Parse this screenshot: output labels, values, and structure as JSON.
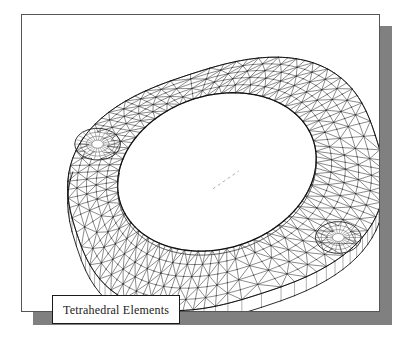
{
  "figure": {
    "caption": "Tetrahedral Elements",
    "background_color": "#ffffff",
    "frame_border_color": "#555555",
    "shadow_color": "#808080",
    "mesh_line_color": "#2b2b2b",
    "outline_color": "#111111"
  },
  "chart_data": {
    "type": "diagram",
    "title": "Tetrahedral Elements",
    "subtitle": "",
    "view": "isometric",
    "element_type": "tetrahedral",
    "legend": [
      {
        "label": "Tetrahedral Elements",
        "position": "bottom-left"
      }
    ],
    "annotations": [
      {
        "label": "Tetrahedral Elements",
        "x": 92,
        "y": 292
      }
    ],
    "geometry": {
      "outer_boundary": {
        "shape": "rounded-oval",
        "center_x": 205,
        "center_y": 170,
        "radius_x": 158,
        "radius_y": 116,
        "rotation_deg": -18
      },
      "inner_opening": {
        "shape": "ellipse",
        "center_x": 196,
        "center_y": 158,
        "radius_x": 102,
        "radius_y": 77,
        "rotation_deg": -18
      },
      "bolt_holes": [
        {
          "name": "upper-left-hole",
          "center_x": 76,
          "center_y": 130,
          "radius": 20
        },
        {
          "name": "lower-right-hole",
          "center_x": 318,
          "center_y": 224,
          "radius": 20
        }
      ],
      "extrusion_depth": 14,
      "center_marker": {
        "x": 205,
        "y": 166,
        "style": "dashed-axis"
      }
    },
    "mesh": {
      "band_divisions_circumferential": 88,
      "band_divisions_radial": 5,
      "triangulation": "diagonal-split quadrilateral band",
      "grid": false
    },
    "xlabel": "",
    "ylabel": ""
  }
}
